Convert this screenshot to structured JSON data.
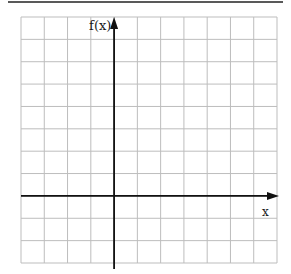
{
  "diagram": {
    "type": "coordinate-grid",
    "y_axis_label": "f(x)",
    "x_axis_label": "x",
    "grid": {
      "columns": 11,
      "rows": 11,
      "y_axis_column_index": 4,
      "x_axis_row_index": 8
    },
    "colors": {
      "grid": "#bdbdbd",
      "axis": "#111111",
      "rule": "#222222"
    }
  }
}
